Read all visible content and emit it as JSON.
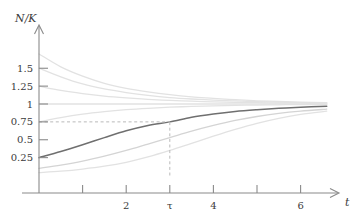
{
  "chart_data": {
    "type": "line",
    "title": "",
    "xlabel": "t",
    "ylabel": "N/K",
    "xlim": [
      -0.12,
      6.75
    ],
    "ylim": [
      0,
      1.72
    ],
    "grid": false,
    "legend": null,
    "x_ticks": [
      1,
      2,
      3,
      4,
      5,
      6
    ],
    "x_tick_labels": [
      "",
      "2",
      "τ",
      "4",
      "",
      "6"
    ],
    "y_ticks": [
      0.25,
      0.5,
      0.75,
      1,
      1.25,
      1.5
    ],
    "y_tick_labels": [
      "0.25",
      "0.5",
      "0.75",
      "1",
      "1.25",
      "1.5"
    ],
    "annotations": [
      {
        "name": "tau-vertical-guide",
        "type": "vline",
        "x": 3,
        "y_from": 0,
        "y_to": 0.75,
        "style": "dashed"
      },
      {
        "name": "n-over-k-guide",
        "type": "hline",
        "y": 0.75,
        "x_from": 0,
        "x_to": 3,
        "style": "dashed"
      },
      {
        "name": "carrying-capacity",
        "type": "asymptote",
        "y": 1
      }
    ],
    "series": [
      {
        "name": "N0=1.70",
        "emphasis": "faint",
        "y0": 1.7,
        "values": [
          [
            0,
            1.7
          ],
          [
            0.5,
            1.52
          ],
          [
            1,
            1.39
          ],
          [
            1.5,
            1.29
          ],
          [
            2,
            1.22
          ],
          [
            2.5,
            1.17
          ],
          [
            3,
            1.13
          ],
          [
            3.5,
            1.1
          ],
          [
            4,
            1.08
          ],
          [
            4.5,
            1.06
          ],
          [
            5,
            1.045
          ],
          [
            5.5,
            1.035
          ],
          [
            6,
            1.027
          ],
          [
            6.6,
            1.02
          ]
        ]
      },
      {
        "name": "N0=1.50",
        "emphasis": "faint",
        "y0": 1.5,
        "values": [
          [
            0,
            1.5
          ],
          [
            0.5,
            1.38
          ],
          [
            1,
            1.28
          ],
          [
            1.5,
            1.21
          ],
          [
            2,
            1.16
          ],
          [
            2.5,
            1.12
          ],
          [
            3,
            1.09
          ],
          [
            3.5,
            1.07
          ],
          [
            4,
            1.055
          ],
          [
            4.5,
            1.043
          ],
          [
            5,
            1.033
          ],
          [
            5.5,
            1.026
          ],
          [
            6,
            1.02
          ],
          [
            6.6,
            1.015
          ]
        ]
      },
      {
        "name": "N0=1.25",
        "emphasis": "faint",
        "y0": 1.25,
        "values": [
          [
            0,
            1.25
          ],
          [
            0.5,
            1.19
          ],
          [
            1,
            1.145
          ],
          [
            1.5,
            1.11
          ],
          [
            2,
            1.085
          ],
          [
            2.5,
            1.065
          ],
          [
            3,
            1.05
          ],
          [
            3.5,
            1.039
          ],
          [
            4,
            1.03
          ],
          [
            4.5,
            1.023
          ],
          [
            5,
            1.018
          ],
          [
            5.5,
            1.014
          ],
          [
            6,
            1.011
          ],
          [
            6.6,
            1.008
          ]
        ]
      },
      {
        "name": "N0=1.00",
        "emphasis": "faint",
        "y0": 1.0,
        "values": [
          [
            0,
            1
          ],
          [
            1,
            1
          ],
          [
            2,
            1
          ],
          [
            3,
            1
          ],
          [
            4,
            1
          ],
          [
            5,
            1
          ],
          [
            6,
            1
          ],
          [
            6.6,
            1
          ]
        ]
      },
      {
        "name": "N0=0.75",
        "emphasis": "faint",
        "y0": 0.75,
        "values": [
          [
            0,
            0.75
          ],
          [
            0.5,
            0.81
          ],
          [
            1,
            0.858
          ],
          [
            1.5,
            0.893
          ],
          [
            2,
            0.92
          ],
          [
            2.5,
            0.94
          ],
          [
            3,
            0.955
          ],
          [
            3.5,
            0.966
          ],
          [
            4,
            0.974
          ],
          [
            4.5,
            0.981
          ],
          [
            5,
            0.985
          ],
          [
            5.5,
            0.989
          ],
          [
            6,
            0.992
          ],
          [
            6.6,
            0.994
          ]
        ]
      },
      {
        "name": "N0=0.25-highlighted",
        "emphasis": "main",
        "y0": 0.25,
        "values": [
          [
            0,
            0.25
          ],
          [
            0.5,
            0.335
          ],
          [
            1,
            0.43
          ],
          [
            1.5,
            0.53
          ],
          [
            2,
            0.625
          ],
          [
            2.5,
            0.7
          ],
          [
            3,
            0.75
          ],
          [
            3.5,
            0.815
          ],
          [
            4,
            0.86
          ],
          [
            4.5,
            0.895
          ],
          [
            5,
            0.92
          ],
          [
            5.5,
            0.94
          ],
          [
            6,
            0.955
          ],
          [
            6.6,
            0.968
          ]
        ]
      },
      {
        "name": "N0=0.10",
        "emphasis": "mid",
        "y0": 0.1,
        "values": [
          [
            0,
            0.1
          ],
          [
            0.5,
            0.145
          ],
          [
            1,
            0.2
          ],
          [
            1.5,
            0.27
          ],
          [
            2,
            0.35
          ],
          [
            2.5,
            0.44
          ],
          [
            3,
            0.53
          ],
          [
            3.5,
            0.62
          ],
          [
            4,
            0.7
          ],
          [
            4.5,
            0.77
          ],
          [
            5,
            0.825
          ],
          [
            5.5,
            0.868
          ],
          [
            6,
            0.9
          ],
          [
            6.6,
            0.928
          ]
        ]
      },
      {
        "name": "N0=0.04",
        "emphasis": "faint",
        "y0": 0.04,
        "values": [
          [
            0,
            0.04
          ],
          [
            0.5,
            0.06
          ],
          [
            1,
            0.09
          ],
          [
            1.5,
            0.13
          ],
          [
            2,
            0.185
          ],
          [
            2.5,
            0.26
          ],
          [
            3,
            0.35
          ],
          [
            3.5,
            0.45
          ],
          [
            4,
            0.55
          ],
          [
            4.5,
            0.645
          ],
          [
            5,
            0.73
          ],
          [
            5.5,
            0.8
          ],
          [
            6,
            0.855
          ],
          [
            6.6,
            0.9
          ]
        ]
      }
    ]
  },
  "axes": {
    "y_axis_caption": "N/K",
    "x_axis_caption": "t",
    "tau_symbol": "τ"
  }
}
